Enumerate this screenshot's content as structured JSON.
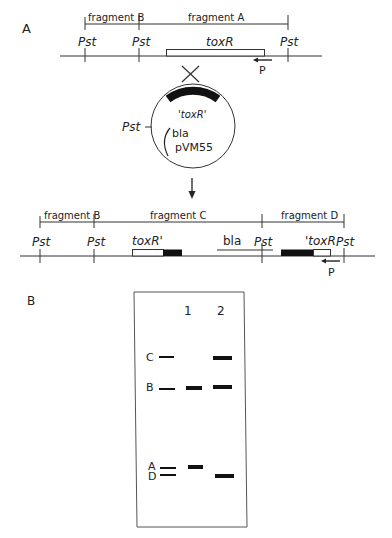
{
  "panel_a": {
    "label": "A",
    "top_map": {
      "fragments": [
        "fragment B",
        "fragment A"
      ],
      "sites": [
        "Pst",
        "Pst",
        "Pst"
      ],
      "gene": "toxR",
      "primer": "P"
    },
    "crossover": "X",
    "plasmid": {
      "name": "pVM55",
      "insert": "'toxR'",
      "marker": "bla",
      "site": "Pst"
    },
    "bottom_map": {
      "fragments": [
        "fragment B",
        "fragment C",
        "fragment D"
      ],
      "sites": [
        "Pst",
        "Pst",
        "Pst",
        "Pst"
      ],
      "genes": [
        "toxR'",
        "'toxR"
      ],
      "marker": "bla",
      "primer": "P"
    }
  },
  "panel_b": {
    "label": "B",
    "lanes": [
      "1",
      "2"
    ],
    "markers": [
      "C",
      "B",
      "A",
      "D"
    ]
  }
}
